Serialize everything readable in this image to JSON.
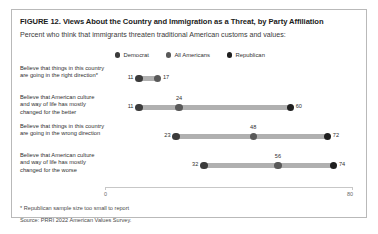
{
  "figure": {
    "title": "FIGURE 12.  Views About the Country and Immigration as a Threat, by Party Affiliation",
    "subtitle": "Percent who think that immigrants threaten traditional American customs and values:",
    "footnote": "* Republican sample size too small to report",
    "source": "Source: PRRI 2022 American Values Survey."
  },
  "colors": {
    "democrat": "#3b3b3b",
    "all_americans": "#595959",
    "republican": "#1f1f1f",
    "connector": "#b0b0b0",
    "axis": "#c7c7c7",
    "border": "#b9b9b9",
    "text": "#2f2f2f"
  },
  "chart_data": {
    "type": "scatter",
    "title": "FIGURE 12.  Views About the Country and Immigration as a Threat, by Party Affiliation",
    "subtitle": "Percent who think that immigrants threaten traditional American customs and values:",
    "xlabel": "",
    "ylabel": "",
    "xlim": [
      0,
      80
    ],
    "xticks": [
      0,
      80
    ],
    "xticklabels": [
      "0",
      "80"
    ],
    "grid": false,
    "legend_position": "top-center",
    "legend": [
      "Democrat",
      "All Americans",
      "Republican"
    ],
    "categories": [
      "Believe that things in this country are going in the right direction*",
      "Believe that American culture and way of life has mostly changed for the better",
      "Believe that things in this country are going in the wrong direction",
      "Believe that American culture and way of life has mostly changed for the worse"
    ],
    "series": [
      {
        "name": "Democrat",
        "values": [
          11,
          11,
          23,
          32
        ]
      },
      {
        "name": "All Americans",
        "values": [
          17,
          24,
          48,
          56
        ]
      },
      {
        "name": "Republican",
        "values": [
          null,
          60,
          72,
          74
        ]
      }
    ]
  },
  "rows": [
    {
      "label": "Believe that things in this country are going in the right direction*",
      "points": [
        {
          "series": "Democrat",
          "value": 11,
          "label": "11",
          "label_pos": "left"
        },
        {
          "series": "All Americans",
          "value": 17,
          "label": "17",
          "label_pos": "right"
        }
      ]
    },
    {
      "label": "Believe that American culture and way of life has mostly changed for the better",
      "points": [
        {
          "series": "Democrat",
          "value": 11,
          "label": "11",
          "label_pos": "left"
        },
        {
          "series": "All Americans",
          "value": 24,
          "label": "24",
          "label_pos": "above"
        },
        {
          "series": "Republican",
          "value": 60,
          "label": "60",
          "label_pos": "right"
        }
      ]
    },
    {
      "label": "Believe that things in this country are going in the wrong direction",
      "points": [
        {
          "series": "Democrat",
          "value": 23,
          "label": "23",
          "label_pos": "left"
        },
        {
          "series": "All Americans",
          "value": 48,
          "label": "48",
          "label_pos": "above"
        },
        {
          "series": "Republican",
          "value": 72,
          "label": "72",
          "label_pos": "right"
        }
      ]
    },
    {
      "label": "Believe that American culture and way of life has mostly changed for the worse",
      "points": [
        {
          "series": "Democrat",
          "value": 32,
          "label": "32",
          "label_pos": "left"
        },
        {
          "series": "All Americans",
          "value": 56,
          "label": "56",
          "label_pos": "above"
        },
        {
          "series": "Republican",
          "value": 74,
          "label": "74",
          "label_pos": "right"
        }
      ]
    }
  ]
}
